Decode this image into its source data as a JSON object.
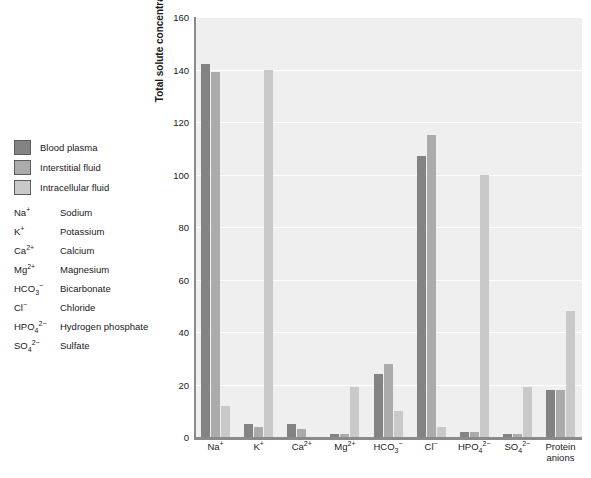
{
  "legend": {
    "items": [
      {
        "label": "Blood plasma",
        "color": "#838383"
      },
      {
        "label": "Interstitial fluid",
        "color": "#ababab"
      },
      {
        "label": "Intracellular fluid",
        "color": "#c9c9c9"
      }
    ]
  },
  "ion_key": [
    {
      "symbol_html": "Na<sup>+</sup>",
      "name": "Sodium"
    },
    {
      "symbol_html": "K<sup>+</sup>",
      "name": "Potassium"
    },
    {
      "symbol_html": "Ca<sup>2+</sup>",
      "name": "Calcium"
    },
    {
      "symbol_html": "Mg<sup>2+</sup>",
      "name": "Magnesium"
    },
    {
      "symbol_html": "HCO<sub>3</sub><sup>&minus;</sup>",
      "name": "Bicarbonate"
    },
    {
      "symbol_html": "Cl<sup>&minus;</sup>",
      "name": "Chloride"
    },
    {
      "symbol_html": "HPO<sub>4</sub><sup>2&minus;</sup>",
      "name": "Hydrogen phosphate"
    },
    {
      "symbol_html": "SO<sub>4</sub><sup>2&minus;</sup>",
      "name": "Sulfate"
    }
  ],
  "chart_data": {
    "type": "bar",
    "title": "",
    "xlabel": "",
    "ylabel": "Total solute concentration (mEq/L)",
    "ylim": [
      0,
      160
    ],
    "yticks": [
      0,
      20,
      40,
      60,
      80,
      100,
      120,
      140,
      160
    ],
    "grid": true,
    "legend_position": "left-outside",
    "categories": [
      "Na+",
      "K+",
      "Ca2+",
      "Mg2+",
      "HCO3-",
      "Cl-",
      "HPO4 2-",
      "SO4 2-",
      "Protein anions"
    ],
    "categories_html": [
      "Na<sup>+</sup>",
      "K<sup>+</sup>",
      "Ca<sup>2+</sup>",
      "Mg<sup>2+</sup>",
      "HCO<sub>3</sub><sup>&minus;</sup>",
      "Cl<sup>&minus;</sup>",
      "HPO<sub>4</sub><sup>2&minus;</sup>",
      "SO<sub>4</sub><sup>2&minus;</sup>",
      "Protein anions"
    ],
    "series": [
      {
        "name": "Blood plasma",
        "color": "#838383",
        "values": [
          142,
          5,
          5,
          1,
          24,
          107,
          2,
          1,
          18
        ]
      },
      {
        "name": "Interstitial fluid",
        "color": "#ablue",
        "values": [
          139,
          4,
          3,
          1,
          28,
          115,
          2,
          1,
          18
        ]
      },
      {
        "name": "Intracellular fluid",
        "color": "#c9c9c9",
        "values": [
          12,
          140,
          0,
          19,
          10,
          4,
          100,
          19,
          48
        ]
      }
    ]
  }
}
